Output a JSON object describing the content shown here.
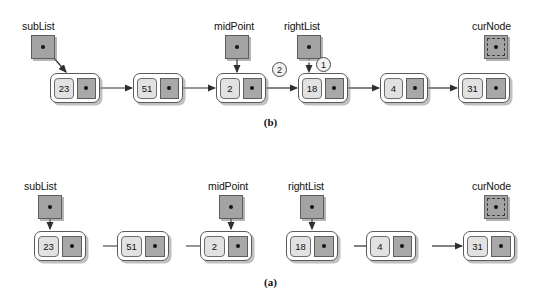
{
  "figure": {
    "colors": {
      "node_fill": "#ffffff",
      "node_border": "#5a5a5a",
      "data_cell_fill": "#e2e2e2",
      "link_cell_fill": "#a8a8a8",
      "pointer_box_fill": "#a3a3a3",
      "arrow_stroke": "#3a3a3a",
      "background": "#ffffff"
    }
  },
  "panel_b": {
    "caption": "(b)",
    "pointers": [
      {
        "id": "subList",
        "label": "subList",
        "style": "solid",
        "target": "node-23"
      },
      {
        "id": "midPoint",
        "label": "midPoint",
        "style": "solid",
        "target": "node-2"
      },
      {
        "id": "rightList",
        "label": "rightList",
        "style": "dashed-arrow",
        "target": "node-18"
      },
      {
        "id": "curNode",
        "label": "curNode",
        "style": "dashed-box",
        "target": null
      }
    ],
    "nodes": [
      {
        "id": "node-23",
        "value": "23",
        "link_icon": "pointer-dot"
      },
      {
        "id": "node-51",
        "value": "51",
        "link_icon": "pointer-dot"
      },
      {
        "id": "node-2",
        "value": "2",
        "link_icon": "pointer-dot"
      },
      {
        "id": "node-18",
        "value": "18",
        "link_icon": "pointer-dot"
      },
      {
        "id": "node-4",
        "value": "4",
        "link_icon": "pointer-dot"
      },
      {
        "id": "node-31",
        "value": "31",
        "link_icon": "pointer-dot"
      }
    ],
    "links": [
      {
        "from": "node-23",
        "to": "node-51"
      },
      {
        "from": "node-51",
        "to": "node-2"
      },
      {
        "from": "node-2",
        "to": "node-18"
      },
      {
        "from": "node-18",
        "to": "node-4"
      },
      {
        "from": "node-4",
        "to": "node-31"
      }
    ],
    "steps": [
      {
        "id": "step-1",
        "label": "1",
        "describes": "rightList now points at node 18"
      },
      {
        "id": "step-2",
        "label": "2",
        "describes": "node 2 link re-connected to node 18"
      }
    ]
  },
  "panel_a": {
    "caption": "(a)",
    "pointers": [
      {
        "id": "subList",
        "label": "subList",
        "style": "solid",
        "target": "node-23"
      },
      {
        "id": "midPoint",
        "label": "midPoint",
        "style": "solid",
        "target": "node-2"
      },
      {
        "id": "rightList",
        "label": "rightList",
        "style": "solid",
        "target": "node-18"
      },
      {
        "id": "curNode",
        "label": "curNode",
        "style": "dashed-box",
        "target": null
      }
    ],
    "nodes": [
      {
        "id": "node-23",
        "value": "23",
        "link_icon": "pointer-dot"
      },
      {
        "id": "node-51",
        "value": "51",
        "link_icon": "pointer-dot"
      },
      {
        "id": "node-2",
        "value": "2",
        "link_icon": "pointer-dot"
      },
      {
        "id": "node-18",
        "value": "18",
        "link_icon": "pointer-dot"
      },
      {
        "id": "node-4",
        "value": "4",
        "link_icon": "pointer-dot"
      },
      {
        "id": "node-31",
        "value": "31",
        "link_icon": "pointer-dot"
      }
    ],
    "links": [
      {
        "from": "node-23",
        "to": "node-51"
      },
      {
        "from": "node-51",
        "to": "node-2"
      },
      {
        "from": "node-18",
        "to": "node-4"
      },
      {
        "from": "node-4",
        "to": "node-31"
      }
    ]
  }
}
